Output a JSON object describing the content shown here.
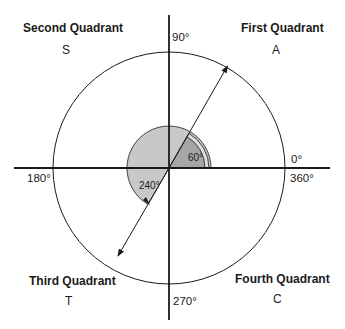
{
  "quadrants": {
    "first": {
      "title": "First Quadrant",
      "letter": "A"
    },
    "second": {
      "title": "Second Quadrant",
      "letter": "S"
    },
    "third": {
      "title": "Third Quadrant",
      "letter": "T"
    },
    "fourth": {
      "title": "Fourth Quadrant",
      "letter": "C"
    }
  },
  "axis_labels": {
    "deg0": "0°",
    "deg90": "90°",
    "deg180": "180°",
    "deg270": "270°",
    "deg360": "360°"
  },
  "angles": {
    "small": {
      "label": "60°",
      "value": 60
    },
    "large": {
      "label": "240°",
      "value": 240
    }
  },
  "colors": {
    "line": "#1a1a1a",
    "large_sector": "#c8c8c8",
    "small_sector": "#a6a6a6",
    "background": "#ffffff"
  }
}
